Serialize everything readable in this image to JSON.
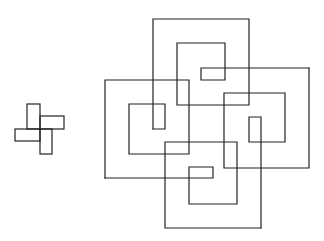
{
  "diagram": {
    "background": "#ffffff",
    "stroke_color": "#222222",
    "small_figure": {
      "name": "pinwheel",
      "rects": [
        {
          "x": 27,
          "y": 104,
          "w": 13,
          "h": 25
        },
        {
          "x": 40,
          "y": 116,
          "w": 24,
          "h": 13
        },
        {
          "x": 40,
          "y": 129,
          "w": 12,
          "h": 25
        },
        {
          "x": 15,
          "y": 129,
          "w": 25,
          "h": 12
        }
      ]
    },
    "large_figure": {
      "name": "interlocking-spirals",
      "paths": [
        {
          "name": "top-spiral",
          "points": "153,129 153,19 249,19 249,105 177,105 177,43 225,43 225,80 201,80 201,68 309,68"
        },
        {
          "name": "right-spiral",
          "points": "309,68 309,168 224,168 224,93 285,93 285,142 249,142 249,117 261,117 261,228"
        },
        {
          "name": "bottom-spiral",
          "points": "261,228 165,228 165,142 237,142 237,204 189,204 189,167 213,167 213,178 105,178"
        },
        {
          "name": "left-spiral",
          "points": "105,178 105,80 189,80 189,154 129,154 129,104 165,104 165,129 153,129"
        }
      ]
    }
  }
}
